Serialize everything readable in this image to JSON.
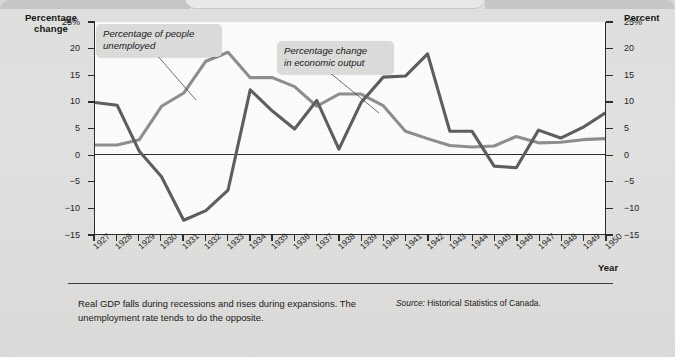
{
  "figure": {
    "axis_titles": {
      "y_left": "Percentage\nchange",
      "y_left_line1": "Percentage",
      "y_left_line2": "change",
      "y_right": "Percent",
      "x": "Year"
    },
    "callouts": [
      {
        "name": "unemployment-callout",
        "line1": "Percentage of people",
        "line2": "unemployed"
      },
      {
        "name": "output-callout",
        "line1": "Percentage change",
        "line2": "in economic output"
      }
    ],
    "caption": {
      "text": "Real GDP falls during recessions and rises during expansions. The unemployment rate tends to do the opposite.",
      "source_label": "Source:",
      "source_value": "Historical Statistics of Canada."
    },
    "colors": {
      "panel_background": "#e0e0de",
      "plot_background": "#ffffff",
      "axis": "#2b2b2b",
      "unemployment_line": "#8f8f8f",
      "output_line": "#5d5d5d",
      "callout_background": "#dededc",
      "text": "#161616"
    }
  },
  "chart_data": {
    "type": "line",
    "title": "",
    "xlabel": "Year",
    "ylabel": "Percentage change",
    "ylabel_right": "Percent",
    "ylim": [
      -15,
      25
    ],
    "yticks": [
      25,
      20,
      15,
      10,
      5,
      0,
      -5,
      -10,
      -15
    ],
    "ytick_labels": [
      "25%",
      "20",
      "15",
      "10",
      "5",
      "0",
      "-5",
      "-10",
      "-15"
    ],
    "grid": false,
    "zero_line": true,
    "legend": "annotations",
    "x": [
      1927,
      1928,
      1929,
      1930,
      1931,
      1932,
      1933,
      1934,
      1935,
      1936,
      1937,
      1938,
      1939,
      1940,
      1941,
      1942,
      1943,
      1944,
      1945,
      1946,
      1947,
      1948,
      1949,
      1950
    ],
    "xtick_labels": [
      "1927",
      "1928",
      "1929",
      "1930",
      "1931",
      "1932",
      "1933",
      "1934",
      "1935",
      "1936",
      "1937",
      "1938",
      "1939",
      "1940",
      "1941",
      "1942",
      "1943",
      "1944",
      "1945",
      "1946",
      "1947",
      "1948",
      "1949",
      "1950"
    ],
    "series": [
      {
        "name": "Percentage of people unemployed",
        "color": "#8f8f8f",
        "values": [
          1.8,
          1.8,
          2.8,
          9.1,
          11.6,
          17.6,
          19.3,
          14.5,
          14.5,
          12.8,
          9.1,
          11.4,
          11.4,
          9.2,
          4.4,
          3.0,
          1.7,
          1.4,
          1.6,
          3.4,
          2.2,
          2.3,
          2.8,
          3.0
        ]
      },
      {
        "name": "Percentage change in economic output",
        "color": "#5d5d5d",
        "values": [
          9.8,
          9.3,
          0.6,
          -4.2,
          -12.4,
          -10.6,
          -6.7,
          12.2,
          8.2,
          4.8,
          10.2,
          1.0,
          9.8,
          14.6,
          14.8,
          19.0,
          4.4,
          4.4,
          -2.2,
          -2.5,
          4.6,
          3.1,
          5.1,
          7.8
        ]
      }
    ]
  }
}
